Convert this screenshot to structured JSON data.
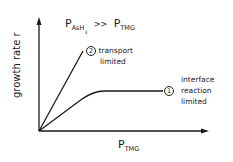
{
  "diagram": {
    "title": {
      "lhs_main": "P",
      "lhs_sub": "AsH",
      "lhs_sub_sub": "3",
      "operator": ">>",
      "rhs_main": "P",
      "rhs_sub": "TMG"
    },
    "y_axis_label": "growth rate  r",
    "x_axis_label": {
      "main": "P",
      "sub": "TMG"
    },
    "curves": [
      {
        "id": "2",
        "marker": "2",
        "label_line1": "transport",
        "label_line2": "limited",
        "shape": "straight line, steep slope from origin"
      },
      {
        "id": "1",
        "marker": "1",
        "label_line1": "interface",
        "label_line2": "reaction",
        "label_line3": "limited",
        "shape": "linear rise from origin then saturating plateau"
      }
    ],
    "line_color": "#1a1a1a"
  }
}
